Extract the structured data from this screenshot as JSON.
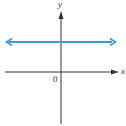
{
  "diagram": {
    "type": "coordinate-plane",
    "axes": {
      "x_label": "x",
      "y_label": "y",
      "origin_label": "0",
      "color": "#333333"
    },
    "line": {
      "description": "horizontal line above x-axis (y = constant, positive)",
      "color": "#3a9ad9",
      "arrows": "both-ends"
    }
  }
}
